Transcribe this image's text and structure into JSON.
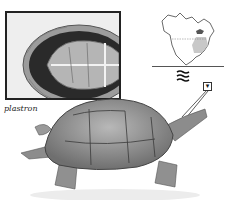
{
  "figure": {
    "inset": {
      "label": "plastron"
    },
    "range_map": {
      "region": "North America",
      "highlight": "eastern United States range shaded"
    },
    "habitat_icon": "water-waves-icon",
    "callout_icon": "magnifier-detail-icon",
    "colors": {
      "background": "#ffffff",
      "ink": "#222222",
      "shell": "#8a8a8a",
      "plastron_dark": "#2a2a2a",
      "plastron_light": "#b5b5b5"
    }
  }
}
